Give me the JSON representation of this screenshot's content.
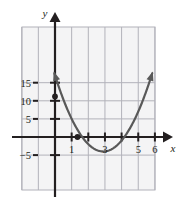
{
  "chart_data": {
    "type": "line",
    "title": "",
    "xlabel": "x",
    "ylabel": "y",
    "grid": true,
    "legend": null,
    "xlim": [
      -2,
      6.9
    ],
    "ylim": [
      -8.1,
      17.5
    ],
    "x_ticks": [
      1,
      2,
      3,
      4,
      5,
      6
    ],
    "x_tick_labels": [
      "1",
      "",
      "3",
      "",
      "5",
      "6"
    ],
    "y_ticks": [
      -5,
      5,
      10,
      15
    ],
    "y_tick_labels": [
      "−5",
      "5",
      "10",
      "15"
    ],
    "grid_x_lines": [
      -2,
      -1,
      0,
      1,
      2,
      3,
      4,
      5,
      6
    ],
    "grid_y_lines": [
      -5,
      0,
      5,
      10,
      15
    ],
    "curve": {
      "name": "parabola",
      "equation": "y = 2.5(x − 2.9)^2 − 4",
      "vertex": [
        2.9,
        -4
      ],
      "y_intercept": 11,
      "roots": [
        1.63,
        4.17
      ],
      "x": [
        0.0,
        0.25,
        0.5,
        0.75,
        1.0,
        1.25,
        1.5,
        1.75,
        2.0,
        2.25,
        2.5,
        2.75,
        3.0,
        3.25,
        3.5,
        3.75,
        4.0,
        4.25,
        4.5,
        4.75,
        5.0,
        5.25,
        5.5,
        5.75,
        6.0
      ],
      "y": [
        17.0,
        14.0,
        10.4,
        7.2,
        5.0,
        2.8,
        0.9,
        -0.7,
        -1.9,
        -2.9,
        -3.6,
        -4.0,
        -4.0,
        -3.7,
        -3.1,
        -2.2,
        -1.0,
        0.5,
        2.3,
        4.4,
        6.8,
        9.5,
        12.5,
        15.8,
        19.4
      ],
      "color": "#595959",
      "arrow_ends": [
        "left-up",
        "right-up"
      ]
    },
    "points": [
      {
        "label": "y-intercept",
        "x": 0,
        "y": 11.2,
        "marker": "filled-circle",
        "color": "#231f20"
      },
      {
        "label": "x-axis point",
        "x": 1.35,
        "y": 0,
        "marker": "filled-circle",
        "color": "#231f20"
      }
    ],
    "colors": {
      "background": "#f4f4f5",
      "grid": "#b2b2ba",
      "axis": "#231f20",
      "curve": "#595959",
      "point": "#231f20"
    }
  }
}
